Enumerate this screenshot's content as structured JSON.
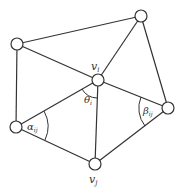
{
  "diagram": {
    "type": "triangle-mesh",
    "nodes": [
      {
        "id": "tl",
        "x": 17,
        "y": 44
      },
      {
        "id": "tr",
        "x": 141,
        "y": 16
      },
      {
        "id": "vi",
        "x": 98,
        "y": 80
      },
      {
        "id": "l",
        "x": 16,
        "y": 127
      },
      {
        "id": "r",
        "x": 168,
        "y": 108
      },
      {
        "id": "vj",
        "x": 95,
        "y": 164
      }
    ],
    "edges": [
      [
        "tl",
        "tr"
      ],
      [
        "tl",
        "vi"
      ],
      [
        "tl",
        "l"
      ],
      [
        "tr",
        "vi"
      ],
      [
        "tr",
        "r"
      ],
      [
        "vi",
        "l"
      ],
      [
        "vi",
        "r"
      ],
      [
        "vi",
        "vj"
      ],
      [
        "l",
        "vj"
      ],
      [
        "r",
        "vj"
      ]
    ],
    "labels": {
      "vi": "v",
      "vi_sub": "i",
      "vj": "v",
      "vj_sub": "j",
      "theta": "θ",
      "theta_sub": "i",
      "alpha": "α",
      "alpha_sub": "ij",
      "beta": "β",
      "beta_sub": "ij"
    }
  }
}
